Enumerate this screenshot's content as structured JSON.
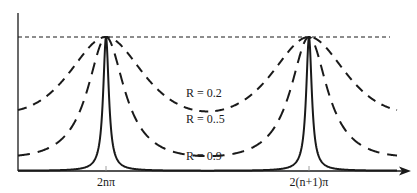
{
  "chart_data": {
    "type": "line",
    "title": "",
    "xlabel": "",
    "ylabel": "",
    "x_ticks": [
      "2nπ",
      "2(n+1)π"
    ],
    "grid": false,
    "reference_line": {
      "y": 1.0,
      "style": "short-dashed",
      "meaning": "maximum transmission"
    },
    "function": "T = 1 / (1 + F sin²(δ/2)), F = 4R/(1-R)²",
    "series": [
      {
        "name": "R = 0.2",
        "label": "R = 0.2",
        "style": "dashed",
        "min_value": 0.444,
        "max_value": 1.0
      },
      {
        "name": "R = 0.5",
        "label": "R = 0..5",
        "style": "long-dashed",
        "min_value": 0.111,
        "max_value": 1.0
      },
      {
        "name": "R = 0.9",
        "label": "R = 0.9",
        "style": "solid",
        "min_value": 0.0028,
        "max_value": 1.0
      }
    ],
    "peaks_at": [
      "2nπ",
      "2(n+1)π"
    ]
  },
  "labels": {
    "r02": "R = 0.2",
    "r05": "R = 0..5",
    "r09": "R = 0.9",
    "tick1": "2nπ",
    "tick2": "2(n+1)π"
  },
  "colors": {
    "ink": "#1a1a1a",
    "background": "#ffffff"
  }
}
